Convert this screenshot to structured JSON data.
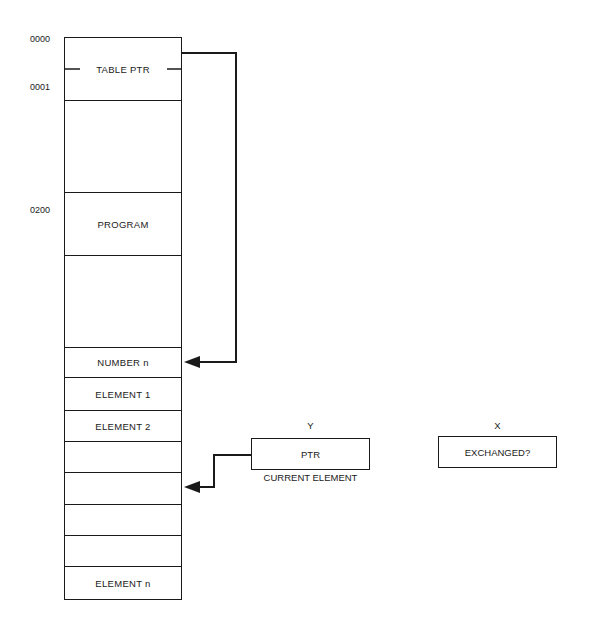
{
  "memory": {
    "addresses": [
      {
        "label": "0000",
        "top": 34
      },
      {
        "label": "0001",
        "top": 82
      },
      {
        "label": "0200",
        "top": 205
      }
    ],
    "cells": [
      {
        "label": "TABLE PTR",
        "top": 37,
        "height": 64
      },
      {
        "label": "",
        "top": 100,
        "height": 93
      },
      {
        "label": "PROGRAM",
        "top": 192,
        "height": 64
      },
      {
        "label": "",
        "top": 255,
        "height": 93
      },
      {
        "label": "NUMBER n",
        "top": 347,
        "height": 31
      },
      {
        "label": "ELEMENT 1",
        "top": 377,
        "height": 34
      },
      {
        "label": "ELEMENT 2",
        "top": 410,
        "height": 32
      },
      {
        "label": "",
        "top": 441,
        "height": 32
      },
      {
        "label": "",
        "top": 472,
        "height": 33
      },
      {
        "label": "",
        "top": 504,
        "height": 32
      },
      {
        "label": "",
        "top": 535,
        "height": 32
      },
      {
        "label": "ELEMENT n",
        "top": 566,
        "height": 34
      }
    ]
  },
  "registers": {
    "y": {
      "name": "Y",
      "content": "PTR",
      "caption": "CURRENT ELEMENT"
    },
    "x": {
      "name": "X",
      "content": "EXCHANGED?"
    }
  }
}
